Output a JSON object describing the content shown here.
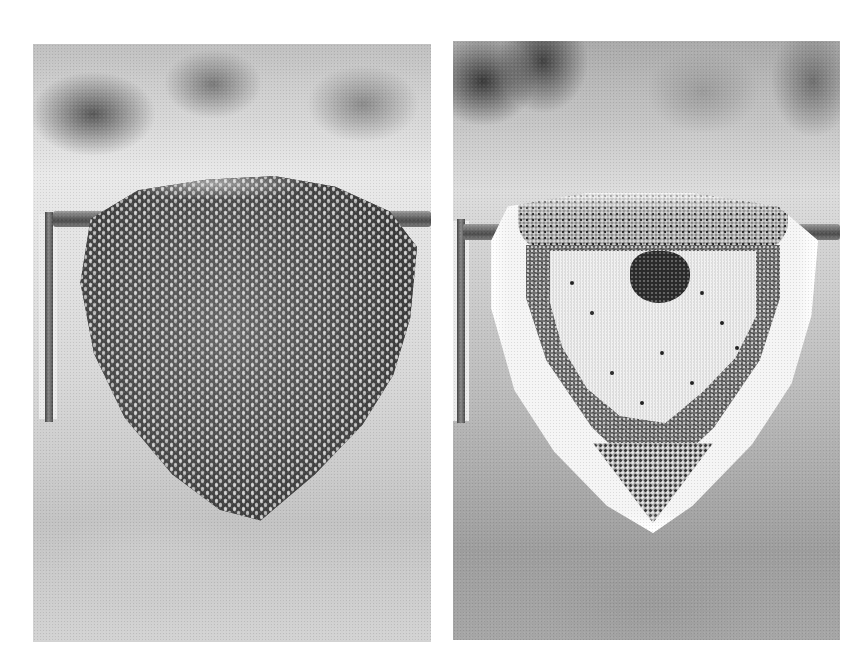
{
  "image": {
    "width": 865,
    "height": 667,
    "background": "#ffffff",
    "style": "black-and-white halftone photographs"
  },
  "panels": [
    {
      "id": "left",
      "subject": "honeybee swarm cluster hanging from horizontal bar",
      "bounds": {
        "x": 33,
        "y": 44,
        "w": 398,
        "h": 598
      }
    },
    {
      "id": "right",
      "subject": "exposed honeycomb hanging from horizontal bar",
      "bounds": {
        "x": 453,
        "y": 41,
        "w": 387,
        "h": 599
      }
    }
  ]
}
